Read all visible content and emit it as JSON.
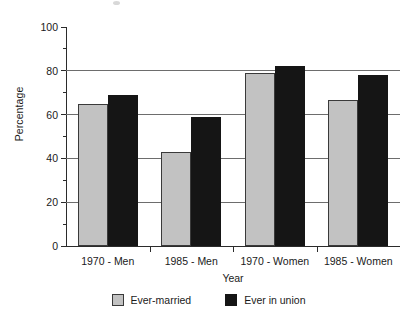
{
  "chart_data": {
    "type": "bar",
    "title": "",
    "subtitle": "",
    "xlabel": "Year",
    "ylabel": "Percentage",
    "categories": [
      "1970 - Men",
      "1985 - Men",
      "1970 - Women",
      "1985 - Women"
    ],
    "series": [
      {
        "name": "Ever-married",
        "color": "#c2c2c2",
        "values": [
          65,
          43,
          79,
          66.5
        ]
      },
      {
        "name": "Ever in union",
        "color": "#151515",
        "values": [
          69,
          59,
          82,
          78
        ]
      }
    ],
    "ylim": [
      0,
      100
    ],
    "ytick_values": [
      0,
      20,
      40,
      60,
      80,
      100
    ],
    "ytick_labels": [
      "0",
      "20",
      "40",
      "60",
      "80",
      "100"
    ],
    "yminor_tick_values": [
      10,
      30,
      50,
      70,
      90
    ],
    "grid": "horizontal-major",
    "grid_color": "#6d6d6d",
    "legend_position": "bottom-center",
    "axis_color": "#2b2b2b",
    "background": "#ffffff"
  },
  "legend": {
    "items": [
      {
        "label": "Ever-married"
      },
      {
        "label": "Ever in union"
      }
    ]
  }
}
